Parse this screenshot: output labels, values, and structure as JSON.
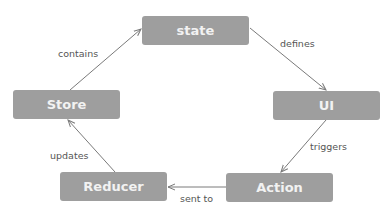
{
  "diagram": {
    "colors": {
      "node_fill": "#9e9e9e",
      "node_text": "#f2f2f2",
      "edge": "#7a7a7a",
      "label": "#555555"
    },
    "nodes": [
      {
        "id": "state",
        "label": "state"
      },
      {
        "id": "ui",
        "label": "UI"
      },
      {
        "id": "action",
        "label": "Action"
      },
      {
        "id": "reducer",
        "label": "Reducer"
      },
      {
        "id": "store",
        "label": "Store"
      }
    ],
    "edges": [
      {
        "from": "state",
        "to": "ui",
        "label": "defines"
      },
      {
        "from": "ui",
        "to": "action",
        "label": "triggers"
      },
      {
        "from": "action",
        "to": "reducer",
        "label": "sent to"
      },
      {
        "from": "reducer",
        "to": "store",
        "label": "updates"
      },
      {
        "from": "store",
        "to": "state",
        "label": "contains"
      }
    ]
  }
}
